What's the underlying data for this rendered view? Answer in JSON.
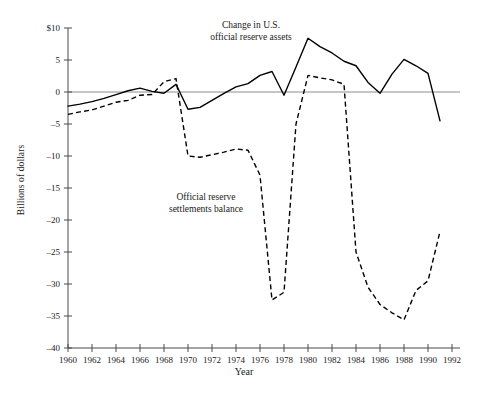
{
  "chart_data": {
    "type": "line",
    "title": "",
    "xlabel": "Year",
    "ylabel": "Billions of dollars",
    "xlim": [
      1960,
      1992
    ],
    "ylim": [
      -40,
      10
    ],
    "xticks": [
      1960,
      1962,
      1964,
      1966,
      1968,
      1970,
      1972,
      1974,
      1976,
      1978,
      1980,
      1982,
      1984,
      1986,
      1988,
      1990,
      1992
    ],
    "xtick_labels": [
      "1960",
      "1962",
      "1964",
      "1966",
      "1968",
      "1970",
      "1972",
      "1974",
      "1976",
      "1978",
      "1980",
      "1982",
      "1984",
      "1986",
      "1988",
      "1990",
      "1992"
    ],
    "yticks": [
      10,
      5,
      0,
      -5,
      -10,
      -15,
      -20,
      -25,
      -30,
      -35,
      -40
    ],
    "ytick_labels": [
      "$10",
      "5",
      "0",
      "-5",
      "-10",
      "-15",
      "-20",
      "-25",
      "-30",
      "-35",
      "-40"
    ],
    "grid": false,
    "legend": "inline-annotations",
    "zero_line": true,
    "series": [
      {
        "name": "Change in U.S. official reserve assets",
        "style": "solid",
        "color": "#000000",
        "x": [
          1960,
          1961,
          1962,
          1963,
          1964,
          1965,
          1966,
          1967,
          1968,
          1969,
          1970,
          1971,
          1972,
          1973,
          1974,
          1975,
          1976,
          1977,
          1978,
          1979,
          1980,
          1981,
          1982,
          1983,
          1984,
          1985,
          1986,
          1987,
          1988,
          1989,
          1990,
          1991
        ],
        "values": [
          -2.2,
          -1.9,
          -1.5,
          -1.0,
          -0.4,
          0.2,
          0.6,
          0.1,
          -0.2,
          1.2,
          -2.7,
          -2.4,
          -1.3,
          -0.2,
          0.8,
          1.3,
          2.6,
          3.2,
          -0.5,
          3.9,
          8.4,
          7.1,
          6.1,
          4.8,
          4.1,
          1.5,
          -0.2,
          2.8,
          5.1,
          4.1,
          2.9,
          -4.5
        ]
      },
      {
        "name": "Official reserve settlements balance",
        "style": "dashed",
        "color": "#000000",
        "x": [
          1960,
          1961,
          1962,
          1963,
          1964,
          1965,
          1966,
          1967,
          1968,
          1969,
          1970,
          1971,
          1972,
          1973,
          1974,
          1975,
          1976,
          1977,
          1978,
          1979,
          1980,
          1981,
          1982,
          1983,
          1984,
          1985,
          1986,
          1987,
          1988,
          1989,
          1990,
          1991
        ],
        "values": [
          -3.5,
          -3.1,
          -2.8,
          -2.2,
          -1.6,
          -1.3,
          -0.5,
          -0.4,
          1.6,
          2.1,
          -10.0,
          -10.2,
          -9.8,
          -9.4,
          -8.9,
          -9.1,
          -13.0,
          -32.5,
          -31.3,
          -5.0,
          2.6,
          2.2,
          1.9,
          1.2,
          -25.0,
          -30.5,
          -33.2,
          -34.5,
          -35.6,
          -31.0,
          -29.5,
          -21.8
        ]
      }
    ],
    "annotations": [
      {
        "id": "assets",
        "lines": [
          "Change in U.S.",
          "official reserve assets"
        ]
      },
      {
        "id": "settlements",
        "lines": [
          "Official reserve",
          "settlements balance"
        ]
      }
    ]
  },
  "colors": {
    "axis": "#4a4a4a",
    "zero_line": "#8c8c8c",
    "line": "#000000",
    "text": "#1a1a1a",
    "background": "#ffffff"
  }
}
